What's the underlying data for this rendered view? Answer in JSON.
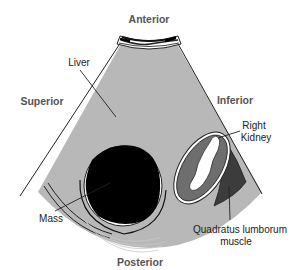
{
  "diagram": {
    "type": "ultrasound-schematic",
    "orientation_labels": {
      "top": "Anterior",
      "left": "Superior",
      "right": "Inferior",
      "bottom": "Posterior"
    },
    "structures": {
      "liver": "Liver",
      "right_kidney_line1": "Right",
      "right_kidney_line2": "Kidney",
      "mass": "Mass",
      "quadratus_line1": "Quadratus lumborum",
      "quadratus_line2": "muscle"
    },
    "colors": {
      "liver_fill": "#b8b8b8",
      "mass_fill": "#000000",
      "kidney_fill": "#6e6e6e",
      "kidney_sinus": "#ffffff",
      "muscle_fill": "#3c3c3c",
      "outline": "#1a1a1a"
    }
  }
}
